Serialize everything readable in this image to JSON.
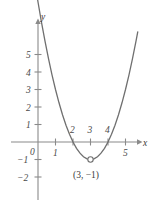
{
  "chart_data": {
    "type": "line",
    "title": "",
    "xlabel": "x",
    "ylabel": "y",
    "xlim": [
      -0.9,
      6.3
    ],
    "ylim": [
      -2.6,
      6.4
    ],
    "grid": false,
    "legend": null,
    "function": "y = (x - 3)^2 - 1",
    "vertex": {
      "x": 3,
      "y": -1,
      "label": "(3, −1)",
      "marker": "open-circle"
    },
    "roots": [
      1.7,
      4.3
    ],
    "y_intercept": 4,
    "x_ticks": [
      {
        "value": 1,
        "label": "1",
        "position": "below"
      },
      {
        "value": 2,
        "label": "2",
        "position": "above"
      },
      {
        "value": 3,
        "label": "3",
        "position": "above"
      },
      {
        "value": 4,
        "label": "4",
        "position": "above"
      },
      {
        "value": 5,
        "label": "5",
        "position": "below"
      }
    ],
    "y_ticks": [
      {
        "value": 5,
        "label": "5"
      },
      {
        "value": 4,
        "label": "4"
      },
      {
        "value": 3,
        "label": "3"
      },
      {
        "value": 2,
        "label": "2"
      },
      {
        "value": 1,
        "label": "1"
      },
      {
        "value": -1,
        "label": "−1"
      },
      {
        "value": -2,
        "label": "−2"
      }
    ],
    "origin_label": "0",
    "curve_points": [
      {
        "x": 1.0,
        "y": 3.0
      },
      {
        "x": 1.2,
        "y": 2.24
      },
      {
        "x": 1.4,
        "y": 1.56
      },
      {
        "x": 1.6,
        "y": 0.96
      },
      {
        "x": 1.8,
        "y": 0.44
      },
      {
        "x": 2.0,
        "y": 0.0
      },
      {
        "x": 2.2,
        "y": -0.36
      },
      {
        "x": 2.4,
        "y": -0.64
      },
      {
        "x": 2.6,
        "y": -0.84
      },
      {
        "x": 2.8,
        "y": -0.96
      },
      {
        "x": 3.0,
        "y": -1.0
      },
      {
        "x": 3.2,
        "y": -0.96
      },
      {
        "x": 3.4,
        "y": -0.84
      },
      {
        "x": 3.6,
        "y": -0.64
      },
      {
        "x": 3.8,
        "y": -0.36
      },
      {
        "x": 4.0,
        "y": 0.0
      },
      {
        "x": 4.2,
        "y": 0.44
      },
      {
        "x": 4.4,
        "y": 0.96
      },
      {
        "x": 4.6,
        "y": 1.56
      },
      {
        "x": 4.8,
        "y": 2.24
      },
      {
        "x": 5.0,
        "y": 3.0
      },
      {
        "x": 5.2,
        "y": 3.84
      },
      {
        "x": 5.4,
        "y": 4.76
      },
      {
        "x": 5.6,
        "y": 5.76
      },
      {
        "x": 5.7,
        "y": 6.29
      }
    ],
    "curve_points_left": [
      {
        "x": -0.45,
        "y": 10.9
      },
      {
        "x": -0.3,
        "y": 9.89
      },
      {
        "x": -0.1,
        "y": 8.61
      },
      {
        "x": 0.0,
        "y": 8.0
      },
      {
        "x": 0.2,
        "y": 6.84
      },
      {
        "x": 0.4,
        "y": 5.76
      },
      {
        "x": 0.6,
        "y": 4.76
      },
      {
        "x": 0.8,
        "y": 3.84
      },
      {
        "x": 1.0,
        "y": 3.0
      }
    ]
  },
  "colors": {
    "curve": "#6f6f6f",
    "axis": "#8a8a8a",
    "text": "#3a3a3a",
    "background": "#ffffff"
  }
}
